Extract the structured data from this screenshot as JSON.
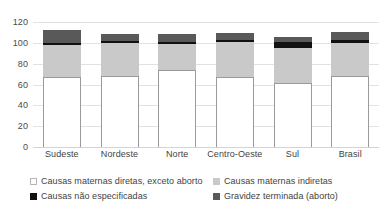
{
  "chart_data": {
    "type": "bar",
    "subtype": "stacked-column",
    "title": "",
    "subtitle": "",
    "xlabel": "",
    "ylabel": "",
    "ylim": [
      0,
      120
    ],
    "y_ticks": [
      0,
      20,
      40,
      60,
      80,
      100,
      120
    ],
    "y_tick_labels": [
      "0",
      "20",
      "40",
      "60",
      "80",
      "100",
      "120"
    ],
    "grid": true,
    "grid_axis": "y",
    "legend_position": "bottom",
    "categories": [
      "Sudeste",
      "Nordeste",
      "Norte",
      "Centro-Oeste",
      "Sul",
      "Brasil"
    ],
    "series": [
      {
        "name": "Causas maternas diretas, exceto aborto",
        "color": "#ffffff",
        "edge_color": "#9a9a9a",
        "values": [
          67,
          68,
          74,
          67,
          61,
          68.5
        ]
      },
      {
        "name": "Causas maternas indiretas",
        "color": "#c9c9c9",
        "values": [
          31,
          32,
          25,
          34,
          34.5,
          31.5
        ]
      },
      {
        "name": "Causas não especificadas",
        "color": "#111111",
        "values": [
          2,
          1.5,
          1.5,
          2,
          5,
          2.5
        ]
      },
      {
        "name": "Gravidez terminada (aborto)",
        "color": "#595959",
        "values": [
          12.5,
          7.5,
          8.5,
          6,
          5,
          8
        ]
      }
    ],
    "totals": [
      112.5,
      109,
      109,
      109,
      105.5,
      110.5
    ]
  },
  "axis": {
    "y_tick_labels": [
      "120",
      "100",
      "80",
      "60",
      "40",
      "20",
      "0"
    ]
  },
  "x_axis": {
    "labels": [
      "Sudeste",
      "Nordeste",
      "Norte",
      "Centro-Oeste",
      "Sul",
      "Brasil"
    ]
  },
  "legend": {
    "items": [
      {
        "label": "Causas maternas diretas, exceto aborto",
        "swatch": "white"
      },
      {
        "label": "Causas maternas indiretas",
        "swatch": "lgray"
      },
      {
        "label": "Causas não especificadas",
        "swatch": "black"
      },
      {
        "label": "Gravidez terminada (aborto)",
        "swatch": "dgray"
      }
    ]
  }
}
